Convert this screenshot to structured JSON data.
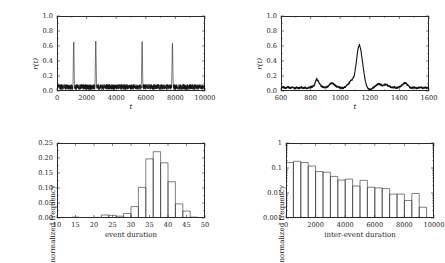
{
  "figure": {
    "background": "#ffffff",
    "ink": "#1a1a1a",
    "panel_count": 4
  },
  "chart_data": [
    {
      "id": "panel-top-left",
      "type": "line",
      "title": "",
      "xlabel": "t",
      "ylabel": "r(t)",
      "xlim": [
        0,
        10000
      ],
      "ylim": [
        0.0,
        1.0
      ],
      "xticks": [
        0,
        2000,
        4000,
        6000,
        8000,
        10000
      ],
      "xtick_labels": [
        "0",
        "2000",
        "4000",
        "6000",
        "8000",
        "10000"
      ],
      "yticks": [
        0.0,
        0.2,
        0.4,
        0.6,
        0.8,
        1.0
      ],
      "ytick_labels": [
        "0.0",
        "0.2",
        "0.4",
        "0.6",
        "0.8",
        "1.0"
      ],
      "grid": false,
      "legend": "none",
      "line_color": "#111111",
      "description": "Noisy baseline near 0.05 with four tall narrow spikes",
      "baseline_mean": 0.05,
      "baseline_noise_amplitude": 0.045,
      "spikes": [
        {
          "x": 1130,
          "y": 0.655
        },
        {
          "x": 2620,
          "y": 0.665
        },
        {
          "x": 5750,
          "y": 0.66
        },
        {
          "x": 7800,
          "y": 0.635
        }
      ]
    },
    {
      "id": "panel-top-right",
      "type": "line",
      "title": "",
      "xlabel": "t",
      "ylabel": "r(t)",
      "xlim": [
        600,
        1600
      ],
      "ylim": [
        0.0,
        1.0
      ],
      "xticks": [
        600,
        800,
        1000,
        1200,
        1400,
        1600
      ],
      "xtick_labels": [
        "600",
        "800",
        "1000",
        "1200",
        "1400",
        "1600"
      ],
      "yticks": [
        0.0,
        0.2,
        0.4,
        0.6,
        0.8,
        1.0
      ],
      "ytick_labels": [
        "0.0",
        "0.2",
        "0.4",
        "0.6",
        "0.8",
        "1.0"
      ],
      "grid": false,
      "legend": "none",
      "line_color": "#111111",
      "description": "Zoomed view of a single event: low noisy baseline with one large peak near t=1130",
      "x": [
        600,
        615,
        630,
        645,
        660,
        675,
        690,
        705,
        720,
        735,
        750,
        765,
        780,
        795,
        810,
        825,
        840,
        855,
        870,
        885,
        900,
        915,
        930,
        945,
        960,
        975,
        990,
        1005,
        1020,
        1035,
        1050,
        1065,
        1080,
        1095,
        1110,
        1120,
        1130,
        1140,
        1150,
        1160,
        1170,
        1180,
        1190,
        1200,
        1215,
        1230,
        1245,
        1260,
        1275,
        1290,
        1305,
        1320,
        1335,
        1350,
        1365,
        1380,
        1395,
        1410,
        1425,
        1440,
        1455,
        1470,
        1485,
        1500,
        1515,
        1530,
        1545,
        1560,
        1575,
        1590
      ],
      "y": [
        0.045,
        0.052,
        0.04,
        0.055,
        0.038,
        0.05,
        0.035,
        0.048,
        0.036,
        0.052,
        0.04,
        0.045,
        0.038,
        0.05,
        0.055,
        0.075,
        0.165,
        0.12,
        0.07,
        0.05,
        0.045,
        0.06,
        0.09,
        0.11,
        0.085,
        0.06,
        0.05,
        0.045,
        0.038,
        0.055,
        0.08,
        0.12,
        0.15,
        0.2,
        0.4,
        0.56,
        0.62,
        0.54,
        0.4,
        0.25,
        0.13,
        0.06,
        0.03,
        0.022,
        0.03,
        0.055,
        0.08,
        0.095,
        0.085,
        0.07,
        0.09,
        0.075,
        0.06,
        0.045,
        0.055,
        0.04,
        0.05,
        0.065,
        0.095,
        0.11,
        0.08,
        0.05,
        0.04,
        0.05,
        0.035,
        0.045,
        0.055,
        0.038,
        0.048,
        0.04
      ]
    },
    {
      "id": "panel-bottom-left",
      "type": "bar",
      "title": "",
      "xlabel": "event duration",
      "ylabel": "normalized frequency",
      "xlim": [
        10,
        50
      ],
      "ylim": [
        0.0,
        0.25
      ],
      "xticks": [
        10,
        15,
        20,
        25,
        30,
        35,
        40,
        45,
        50
      ],
      "xtick_labels": [
        "10",
        "15",
        "20",
        "25",
        "30",
        "35",
        "40",
        "45",
        "50"
      ],
      "yticks": [
        0.0,
        0.05,
        0.1,
        0.15,
        0.2,
        0.25
      ],
      "ytick_labels": [
        "0.00",
        "0.05",
        "0.10",
        "0.15",
        "0.20",
        "0.25"
      ],
      "grid": false,
      "legend": "none",
      "bar_edge_color": "#2b2b2b",
      "bar_fill_color": "#ffffff",
      "bin_width": 2,
      "bin_starts": [
        14,
        16,
        18,
        20,
        22,
        24,
        26,
        28,
        30,
        32,
        34,
        36,
        38,
        40,
        42,
        44,
        46
      ],
      "values": [
        0.003,
        0.0015,
        0.0,
        0.002,
        0.01,
        0.009,
        0.006,
        0.015,
        0.038,
        0.102,
        0.197,
        0.221,
        0.184,
        0.121,
        0.047,
        0.023,
        0.003
      ]
    },
    {
      "id": "panel-bottom-right",
      "type": "bar",
      "title": "",
      "xlabel": "inter-event duration",
      "ylabel": "normalized frequency",
      "xlim": [
        0,
        10000
      ],
      "ylim": [
        0.001,
        1
      ],
      "yscale": "log",
      "xticks": [
        0,
        2000,
        4000,
        6000,
        8000,
        10000
      ],
      "xtick_labels": [
        "0",
        "2000",
        "4000",
        "6000",
        "8000",
        "10000"
      ],
      "yticks": [
        0.001,
        0.01,
        0.1,
        1
      ],
      "ytick_labels": [
        "0.001",
        "0.01",
        "0.1",
        "1"
      ],
      "grid": false,
      "legend": "none",
      "bar_edge_color": "#2b2b2b",
      "bar_fill_color": "#ffffff",
      "bin_width": 500,
      "bin_starts": [
        0,
        500,
        1000,
        1500,
        2000,
        2500,
        3000,
        3500,
        4000,
        4500,
        5000,
        5500,
        6000,
        6500,
        7000,
        7500,
        8000,
        8500,
        9000
      ],
      "values": [
        0.165,
        0.185,
        0.165,
        0.12,
        0.072,
        0.068,
        0.046,
        0.033,
        0.036,
        0.019,
        0.032,
        0.017,
        0.016,
        0.015,
        0.009,
        0.009,
        0.005,
        0.0095,
        0.0027
      ]
    }
  ]
}
